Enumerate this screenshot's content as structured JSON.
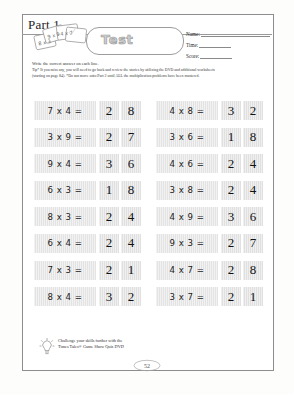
{
  "document": {
    "part_title": "Part 1",
    "banner_label": "Test",
    "page_number": "52"
  },
  "fields": [
    {
      "label": "Name:",
      "value": "",
      "short": false
    },
    {
      "label": "Time:",
      "value": "",
      "short": true
    },
    {
      "label": "Score:",
      "value": "",
      "short": true
    }
  ],
  "instructions": [
    {
      "text": "Write the correct answer on each line.",
      "tip": false
    },
    {
      "text": "Tip* If you miss any, you will need to go back and review the stories by utilizing the DVD and additional worksheets",
      "tip": true
    },
    {
      "text": "(starting on page 84). *Do not move onto Part 2 until ALL the multiplication problems have been mastered.",
      "tip": true
    }
  ],
  "problems": {
    "left_column": [
      {
        "expression": "7 x 4 =",
        "answer_digits": [
          "2",
          "8"
        ]
      },
      {
        "expression": "3 x 9 =",
        "answer_digits": [
          "2",
          "7"
        ]
      },
      {
        "expression": "9 x 4 =",
        "answer_digits": [
          "3",
          "6"
        ]
      },
      {
        "expression": "6 x 3 =",
        "answer_digits": [
          "1",
          "8"
        ]
      },
      {
        "expression": "8 x 3 =",
        "answer_digits": [
          "2",
          "4"
        ]
      },
      {
        "expression": "6 x 4 =",
        "answer_digits": [
          "2",
          "4"
        ]
      },
      {
        "expression": "7 x 3 =",
        "answer_digits": [
          "2",
          "1"
        ]
      },
      {
        "expression": "8 x 4 =",
        "answer_digits": [
          "3",
          "2"
        ]
      }
    ],
    "right_column": [
      {
        "expression": "4 x 8 =",
        "answer_digits": [
          "3",
          "2"
        ]
      },
      {
        "expression": "3 x 6 =",
        "answer_digits": [
          "1",
          "8"
        ]
      },
      {
        "expression": "4 x 6 =",
        "answer_digits": [
          "2",
          "4"
        ]
      },
      {
        "expression": "3 x 8 =",
        "answer_digits": [
          "2",
          "4"
        ]
      },
      {
        "expression": "4 x 9 =",
        "answer_digits": [
          "3",
          "6"
        ]
      },
      {
        "expression": "9 x 3 =",
        "answer_digits": [
          "2",
          "7"
        ]
      },
      {
        "expression": "4 x 7 =",
        "answer_digits": [
          "2",
          "8"
        ]
      },
      {
        "expression": "3 x 7 =",
        "answer_digits": [
          "2",
          "1"
        ]
      }
    ]
  },
  "footer": {
    "line1": "Challenge your skills further with the",
    "line2": "Times Tales® Game Show Quiz DVD",
    "icon": "lightbulb-icon"
  },
  "colors": {
    "cell_fill": "#e3e3e3",
    "answer_fill": "#e0e0e0",
    "border": "#8d8d8d",
    "text": "#1a1a1a"
  }
}
